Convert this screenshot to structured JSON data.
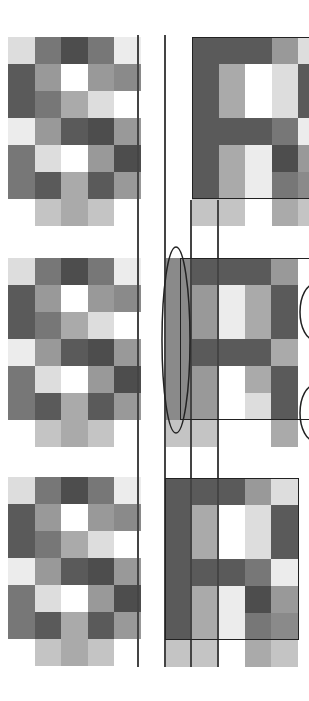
{
  "diagram": {
    "palette": {
      "D": "#5a5a5a",
      "K": "#4d4d4d",
      "G": "#777777",
      "M": "#8a8a8a",
      "S": "#999999",
      "A": "#aaaaaa",
      "C": "#c4c4c4",
      "L": "#dddddd",
      "E": "#ececec",
      "W": "#ffffff"
    },
    "left_pattern": [
      [
        "L",
        "G",
        "K",
        "G",
        "E"
      ],
      [
        "D",
        "S",
        "W",
        "S",
        "M"
      ],
      [
        "D",
        "G",
        "A",
        "L",
        "W"
      ],
      [
        "E",
        "S",
        "D",
        "K",
        "S"
      ],
      [
        "G",
        "L",
        "W",
        "S",
        "K"
      ],
      [
        "G",
        "D",
        "A",
        "D",
        "S"
      ],
      [
        "W",
        "C",
        "A",
        "C",
        "W"
      ]
    ],
    "r_pattern": [
      [
        "D",
        "D",
        "D",
        "S",
        "L"
      ],
      [
        "D",
        "A",
        "W",
        "L",
        "D"
      ],
      [
        "D",
        "A",
        "W",
        "L",
        "D"
      ],
      [
        "D",
        "D",
        "D",
        "G",
        "E"
      ],
      [
        "D",
        "A",
        "E",
        "K",
        "S"
      ],
      [
        "D",
        "A",
        "E",
        "G",
        "M"
      ],
      [
        "C",
        "C",
        "W",
        "A",
        "C"
      ]
    ],
    "mid_pattern": [
      [
        "M",
        "D",
        "D",
        "D",
        "S"
      ],
      [
        "M",
        "S",
        "E",
        "A",
        "D"
      ],
      [
        "M",
        "S",
        "E",
        "A",
        "D"
      ],
      [
        "M",
        "D",
        "D",
        "D",
        "A"
      ],
      [
        "M",
        "S",
        "W",
        "A",
        "D"
      ],
      [
        "M",
        "S",
        "W",
        "L",
        "D"
      ],
      [
        "C",
        "C",
        "W",
        "W",
        "A"
      ]
    ],
    "panels": [
      {
        "name": "top",
        "left_y": 37,
        "right_x": 192,
        "right_y": 37,
        "pattern": "r_pattern"
      },
      {
        "name": "middle",
        "left_y": 258,
        "right_x": 165,
        "right_y": 258,
        "pattern": "mid_pattern"
      },
      {
        "name": "bottom",
        "left_y": 477,
        "right_x": 165,
        "right_y": 478,
        "pattern": "r_pattern"
      }
    ]
  }
}
